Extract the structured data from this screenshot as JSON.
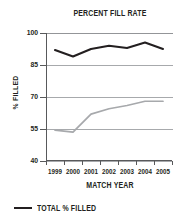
{
  "chart_data": {
    "type": "line",
    "title": "PERCENT FILL RATE",
    "xlabel": "MATCH YEAR",
    "ylabel": "% FILLED",
    "categories": [
      "1999",
      "2000",
      "2001",
      "2002",
      "2003",
      "2004",
      "2005"
    ],
    "ylim": [
      40,
      100
    ],
    "yticks": [
      100,
      85,
      70,
      55,
      40
    ],
    "grid": true,
    "legend_position": "bottom-left",
    "series": [
      {
        "name": "TOTAL % FILLED",
        "color": "#231f20",
        "values": [
          92.0,
          89.0,
          92.5,
          94.0,
          93.0,
          95.5,
          92.5
        ]
      },
      {
        "name": "",
        "color": "#a7a9ac",
        "values": [
          54.5,
          53.5,
          62.0,
          64.5,
          66.0,
          68.0,
          68.0
        ]
      }
    ]
  },
  "legend": {
    "items": [
      {
        "label": "TOTAL % FILLED",
        "color": "#231f20"
      }
    ]
  },
  "colors": {
    "ink": "#231f20",
    "axis": "#58595b",
    "grid": "#a7a9ac",
    "secondary_series": "#a7a9ac"
  }
}
